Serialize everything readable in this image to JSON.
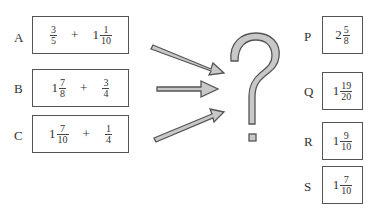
{
  "questions": [
    {
      "label": "A",
      "left": {
        "whole": "",
        "num": "3",
        "den": "5"
      },
      "op": "+",
      "right": {
        "whole": "1",
        "num": "1",
        "den": "10"
      }
    },
    {
      "label": "B",
      "left": {
        "whole": "1",
        "num": "7",
        "den": "8"
      },
      "op": "+",
      "right": {
        "whole": "",
        "num": "3",
        "den": "4"
      }
    },
    {
      "label": "C",
      "left": {
        "whole": "1",
        "num": "7",
        "den": "10"
      },
      "op": "+",
      "right": {
        "whole": "",
        "num": "1",
        "den": "4"
      }
    }
  ],
  "answers": [
    {
      "label": "P",
      "whole": "2",
      "num": "5",
      "den": "8"
    },
    {
      "label": "Q",
      "whole": "1",
      "num": "19",
      "den": "20"
    },
    {
      "label": "R",
      "whole": "1",
      "num": "9",
      "den": "10"
    },
    {
      "label": "S",
      "whole": "1",
      "num": "7",
      "den": "10"
    }
  ],
  "center_symbol": "?",
  "colors": {
    "shape_fill": "#c8c8c8",
    "shape_stroke": "#555555",
    "box_border": "#555555"
  }
}
